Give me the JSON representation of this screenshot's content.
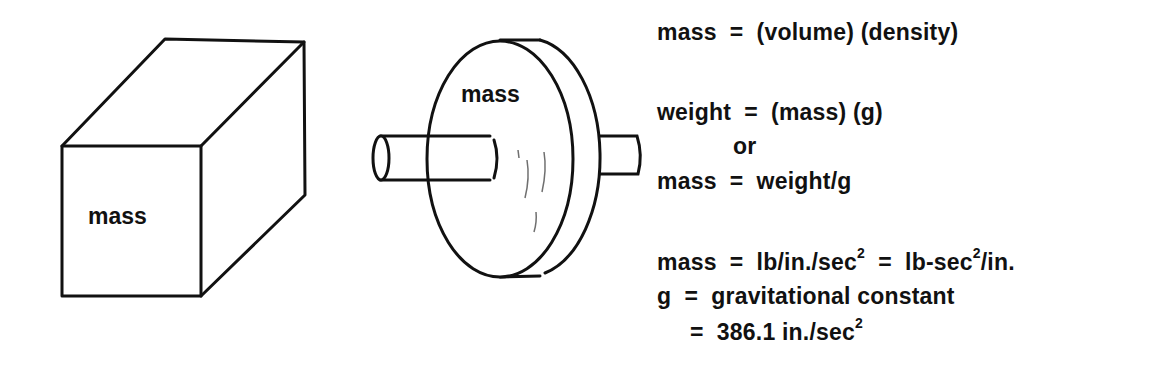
{
  "figure": {
    "cube": {
      "label": "mass"
    },
    "disk": {
      "label": "mass"
    }
  },
  "equations": {
    "line1": "mass  =  (volume) (density)",
    "line2": "weight  =  (mass) (g)",
    "line3": "or",
    "line4": "mass  =  weight/g",
    "line5": {
      "part1": "mass  =  lb/in./sec",
      "exp1": "2",
      "part2": "  =  lb-sec",
      "exp2": "2",
      "part3": "/in."
    },
    "line6": "g  =  gravitational constant",
    "line7": {
      "part1": "=  386.1 in./sec",
      "exp1": "2"
    }
  }
}
